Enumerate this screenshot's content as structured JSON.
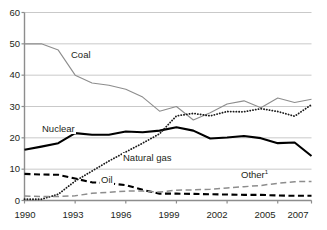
{
  "chart_data": {
    "type": "line",
    "title": "",
    "subtitle": "",
    "xlabel": "",
    "ylabel": "",
    "xlim": [
      1990,
      2007
    ],
    "ylim": [
      0,
      60
    ],
    "grid": true,
    "grid_axis": "y",
    "legend": "inline-annotations",
    "x": [
      1990,
      1991,
      1992,
      1993,
      1994,
      1995,
      1996,
      1997,
      1998,
      1999,
      2000,
      2001,
      2002,
      2003,
      2004,
      2005,
      2006,
      2007
    ],
    "xticks": [
      "1990",
      "1993",
      "1996",
      "1999",
      "2002",
      "2005",
      "2007"
    ],
    "xtick_values": [
      1990,
      1993,
      1996,
      1999,
      2002,
      2005,
      2007
    ],
    "yticks": [
      "0",
      "10",
      "20",
      "30",
      "40",
      "50",
      "60"
    ],
    "ytick_values": [
      0,
      10,
      20,
      30,
      40,
      50,
      60
    ],
    "series": [
      {
        "name": "Coal",
        "style": "solid-thin-gray",
        "color": "#8d8d8d",
        "values": [
          50.0,
          50.0,
          48.0,
          40.0,
          37.5,
          36.8,
          35.5,
          33.0,
          28.5,
          30.0,
          25.7,
          28.0,
          30.8,
          31.8,
          29.6,
          32.7,
          31.3,
          32.3
        ]
      },
      {
        "name": "Nuclear",
        "style": "solid-thick-black",
        "color": "#000000",
        "values": [
          16.2,
          17.2,
          18.3,
          21.5,
          21.0,
          21.0,
          22.0,
          21.8,
          22.3,
          23.4,
          22.3,
          19.8,
          20.1,
          20.6,
          19.9,
          18.3,
          18.5,
          14.2
        ]
      },
      {
        "name": "Natural gas",
        "style": "dotted-black",
        "color": "#1a1a1a",
        "values": [
          0.4,
          0.4,
          2.0,
          6.2,
          9.4,
          12.6,
          15.5,
          18.3,
          21.3,
          27.0,
          27.8,
          27.0,
          28.4,
          28.3,
          29.3,
          28.4,
          26.9,
          30.6
        ]
      },
      {
        "name": "Oil",
        "style": "dashed-thick-black",
        "color": "#000000",
        "values": [
          8.5,
          8.3,
          8.2,
          7.0,
          5.8,
          5.5,
          4.9,
          3.4,
          2.2,
          2.2,
          2.1,
          2.0,
          1.9,
          1.8,
          1.8,
          1.6,
          1.5,
          1.5
        ]
      },
      {
        "name": "Other",
        "footnote": "1",
        "style": "dashed-thin-gray",
        "color": "#8d8d8d",
        "values": [
          1.4,
          1.3,
          1.3,
          1.5,
          2.3,
          2.6,
          3.0,
          3.0,
          2.7,
          3.3,
          3.4,
          3.6,
          4.0,
          4.4,
          4.8,
          5.5,
          6.0,
          6.1
        ]
      }
    ],
    "annotations": [
      {
        "label": "Coal",
        "x": 1992.2,
        "y": 44.5
      },
      {
        "label": "Nuclear",
        "x": 1991.3,
        "y": 23.6
      },
      {
        "label": "Natural gas",
        "x": 1996.4,
        "y": 14.2
      },
      {
        "label": "Oil",
        "x": 1995.6,
        "y": 5.9
      },
      {
        "label": "Other",
        "footnote": "1",
        "x": 2004.1,
        "y": 7.4
      }
    ]
  },
  "axis": {
    "y_ticks": [
      {
        "label": "60"
      },
      {
        "label": "50"
      },
      {
        "label": "40"
      },
      {
        "label": "30"
      },
      {
        "label": "20"
      },
      {
        "label": "10"
      },
      {
        "label": "0"
      }
    ],
    "x_ticks": [
      {
        "label": "1990"
      },
      {
        "label": "1993"
      },
      {
        "label": "1996"
      },
      {
        "label": "1999"
      },
      {
        "label": "2002"
      },
      {
        "label": "2005"
      },
      {
        "label": "2007"
      }
    ]
  },
  "labels": {
    "coal": "Coal",
    "nuclear": "Nuclear",
    "natural_gas": "Natural gas",
    "oil": "Oil",
    "other": "Other",
    "other_footnote": "1"
  },
  "colors": {
    "gridline": "#c9c9c9",
    "axis": "#8d8d8d",
    "text": "#231f20",
    "gray_series": "#8d8d8d",
    "black_series": "#000000",
    "background": "#ffffff"
  }
}
